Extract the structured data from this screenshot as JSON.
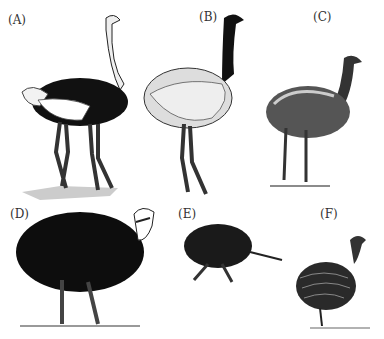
{
  "figure": {
    "panels": [
      {
        "label": "(A)",
        "subject": "ostrich"
      },
      {
        "label": "(B)",
        "subject": "rhea"
      },
      {
        "label": "(C)",
        "subject": "emu"
      },
      {
        "label": "(D)",
        "subject": "cassowary"
      },
      {
        "label": "(E)",
        "subject": "kiwi"
      },
      {
        "label": "(F)",
        "subject": "tinamou"
      }
    ]
  }
}
